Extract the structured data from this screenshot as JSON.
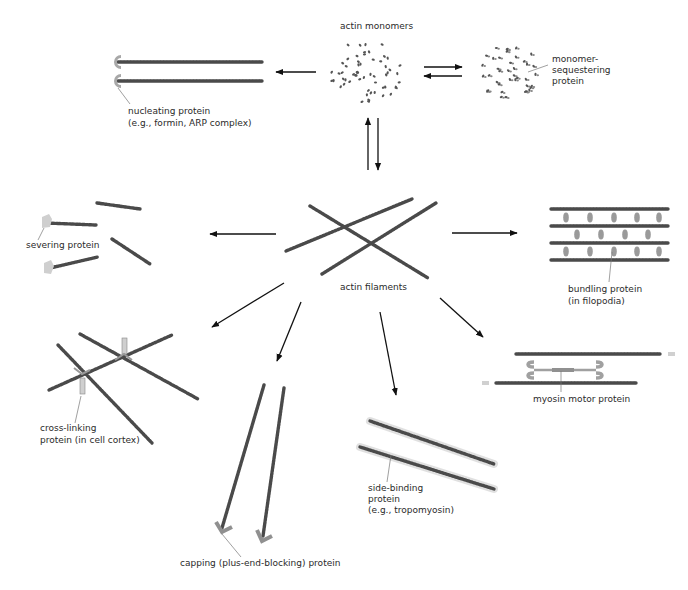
{
  "diagram": {
    "nodes": {
      "monomers": {
        "label": "actin monomers"
      },
      "sequestering": {
        "label_lines": [
          "monomer-",
          "sequestering",
          "protein"
        ]
      },
      "nucleating": {
        "label_lines": [
          "nucleating protein",
          "(e.g., formin, ARP complex)"
        ]
      },
      "filaments": {
        "label": "actin filaments"
      },
      "severing": {
        "label": "severing protein"
      },
      "bundling": {
        "label_lines": [
          "bundling protein",
          "(in filopodia)"
        ]
      },
      "crosslinking": {
        "label_lines": [
          "cross-linking",
          "protein (in cell cortex)"
        ]
      },
      "capping": {
        "label": "capping (plus-end-blocking) protein"
      },
      "sidebinding": {
        "label_lines": [
          "side-binding",
          "protein",
          "(e.g., tropomyosin)"
        ]
      },
      "myosin": {
        "label": "myosin motor protein"
      }
    },
    "edges": [
      {
        "from": "monomers",
        "to": "nucleating",
        "type": "one-way"
      },
      {
        "from": "monomers",
        "to": "sequestering",
        "type": "reversible"
      },
      {
        "from": "monomers",
        "to": "filaments",
        "type": "reversible"
      },
      {
        "from": "filaments",
        "to": "severing",
        "type": "one-way"
      },
      {
        "from": "filaments",
        "to": "bundling",
        "type": "one-way"
      },
      {
        "from": "filaments",
        "to": "crosslinking",
        "type": "one-way"
      },
      {
        "from": "filaments",
        "to": "capping",
        "type": "one-way"
      },
      {
        "from": "filaments",
        "to": "sidebinding",
        "type": "one-way"
      },
      {
        "from": "filaments",
        "to": "myosin",
        "type": "one-way"
      }
    ],
    "colors": {
      "filament": "#4a4a4a",
      "accessory_protein": "#a8a8a8",
      "arrow": "#111111",
      "text": "#2a2a2a"
    }
  }
}
